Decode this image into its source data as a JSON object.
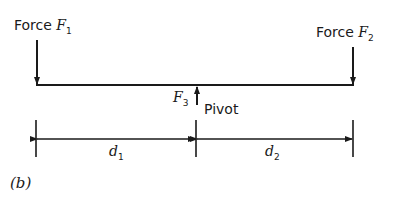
{
  "diagram": {
    "force1": {
      "prefix": "Force ",
      "symbol": "F",
      "sub": "1"
    },
    "force2": {
      "prefix": "Force ",
      "symbol": "F",
      "sub": "2"
    },
    "force3": {
      "symbol": "F",
      "sub": "3"
    },
    "pivot_label": "Pivot",
    "d1": {
      "symbol": "d",
      "sub": "1"
    },
    "d2": {
      "symbol": "d",
      "sub": "2"
    },
    "caption": "(b)"
  }
}
